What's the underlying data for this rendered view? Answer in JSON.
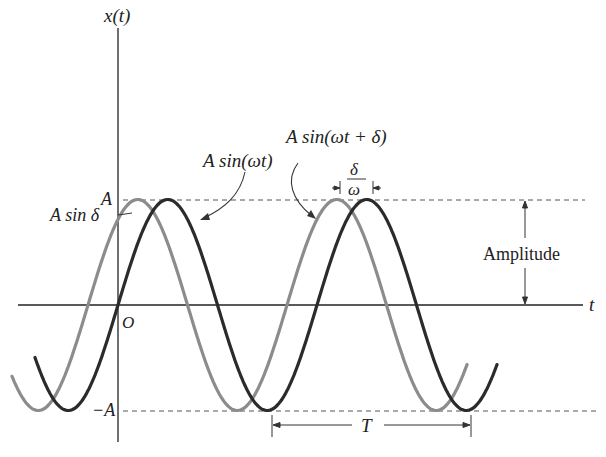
{
  "diagram": {
    "y_axis_label": "x(t)",
    "x_axis_label": "t",
    "origin_label": "O",
    "amplitude_top_label": "A",
    "amplitude_bottom_label": "−A",
    "phase_value_label": "A sin δ",
    "curve_dark_label": "A sin(ωt)",
    "curve_light_label": "A sin(ωt + δ)",
    "shift_label_num": "δ",
    "shift_label_den": "ω",
    "amplitude_label": "Amplitude",
    "period_label": "T",
    "colors": {
      "dark_curve": "#2b2b2b",
      "light_curve": "#8c8c8c",
      "axis": "#222222",
      "dashed": "#555555"
    }
  }
}
